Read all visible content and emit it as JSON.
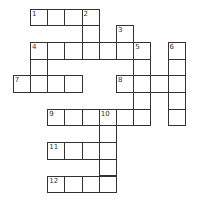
{
  "puzzle": {
    "type": "crossword",
    "origin": {
      "x": 13.3,
      "y": 9
    },
    "cell_w": 17.2,
    "cell_h": 16.7,
    "cells": [
      {
        "r": 0,
        "c": 1,
        "n": "1"
      },
      {
        "r": 0,
        "c": 2
      },
      {
        "r": 0,
        "c": 3
      },
      {
        "r": 0,
        "c": 4,
        "n": "2"
      },
      {
        "r": 1,
        "c": 4
      },
      {
        "r": 1,
        "c": 6,
        "n": "3"
      },
      {
        "r": 2,
        "c": 1,
        "n": "4"
      },
      {
        "r": 2,
        "c": 2
      },
      {
        "r": 2,
        "c": 3
      },
      {
        "r": 2,
        "c": 4
      },
      {
        "r": 2,
        "c": 5
      },
      {
        "r": 2,
        "c": 6
      },
      {
        "r": 2,
        "c": 7,
        "n": "5"
      },
      {
        "r": 2,
        "c": 9,
        "n": "6"
      },
      {
        "r": 3,
        "c": 1
      },
      {
        "r": 3,
        "c": 7
      },
      {
        "r": 3,
        "c": 9
      },
      {
        "r": 4,
        "c": 0,
        "n": "7"
      },
      {
        "r": 4,
        "c": 1
      },
      {
        "r": 4,
        "c": 2
      },
      {
        "r": 4,
        "c": 3
      },
      {
        "r": 4,
        "c": 6,
        "n": "8"
      },
      {
        "r": 4,
        "c": 7
      },
      {
        "r": 4,
        "c": 8
      },
      {
        "r": 4,
        "c": 9
      },
      {
        "r": 5,
        "c": 7
      },
      {
        "r": 5,
        "c": 9
      },
      {
        "r": 6,
        "c": 2,
        "n": "9"
      },
      {
        "r": 6,
        "c": 3
      },
      {
        "r": 6,
        "c": 4
      },
      {
        "r": 6,
        "c": 5,
        "n": "10"
      },
      {
        "r": 6,
        "c": 6
      },
      {
        "r": 6,
        "c": 7
      },
      {
        "r": 6,
        "c": 9
      },
      {
        "r": 7,
        "c": 5
      },
      {
        "r": 8,
        "c": 2,
        "n": "11"
      },
      {
        "r": 8,
        "c": 3
      },
      {
        "r": 8,
        "c": 4
      },
      {
        "r": 8,
        "c": 5
      },
      {
        "r": 9,
        "c": 5
      },
      {
        "r": 10,
        "c": 2,
        "n": "12"
      },
      {
        "r": 10,
        "c": 3
      },
      {
        "r": 10,
        "c": 4
      },
      {
        "r": 10,
        "c": 5
      }
    ]
  }
}
